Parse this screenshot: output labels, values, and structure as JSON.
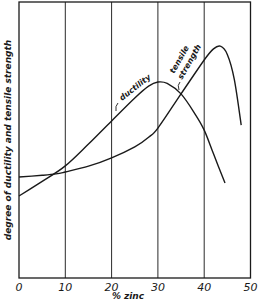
{
  "chart_data": {
    "type": "line",
    "title": "",
    "xlabel": "% zinc",
    "ylabel": "degree of ductility and tensile strength",
    "xlim": [
      0,
      50
    ],
    "ylim": [
      0,
      100
    ],
    "x_ticks": [
      "0",
      "10",
      "20",
      "30",
      "40",
      "50"
    ],
    "y_ticks": [],
    "grid": {
      "vertical": true,
      "horizontal": false
    },
    "legend": null,
    "series": [
      {
        "name": "ductility",
        "label": "ductility",
        "x": [
          0,
          5,
          10,
          15,
          20,
          25,
          28,
          30,
          32,
          35,
          38,
          40,
          42,
          44.5
        ],
        "y": [
          29.7,
          35,
          40.6,
          48.5,
          56.9,
          65.2,
          69.5,
          71,
          70.5,
          66.7,
          59.5,
          53.6,
          45,
          34.4
        ]
      },
      {
        "name": "tensile strength",
        "label": "tensile strength",
        "x": [
          0,
          5,
          8,
          10,
          15,
          20,
          25,
          28,
          30,
          35,
          40,
          42,
          43.5,
          45,
          46.5,
          48
        ],
        "y": [
          36.6,
          37.2,
          37.7,
          38.4,
          40.5,
          43.5,
          47.5,
          51,
          54.3,
          66.7,
          79,
          83,
          84,
          81,
          72,
          55.4
        ]
      }
    ],
    "annotations": [
      {
        "text": "ductility",
        "series": "ductility",
        "at_x": 23
      },
      {
        "text": "tensile",
        "series": "tensile strength",
        "at_x": 35
      },
      {
        "text": "strength",
        "series": "tensile strength",
        "at_x": 35
      }
    ]
  },
  "labels": {
    "xlabel": "% zinc",
    "ylabel": "degree of ductility and tensile strength",
    "ductility": "ductility",
    "tensile_line1": "tensile",
    "tensile_line2": "strength",
    "ticks": [
      "0",
      "10",
      "20",
      "30",
      "40",
      "50"
    ]
  }
}
